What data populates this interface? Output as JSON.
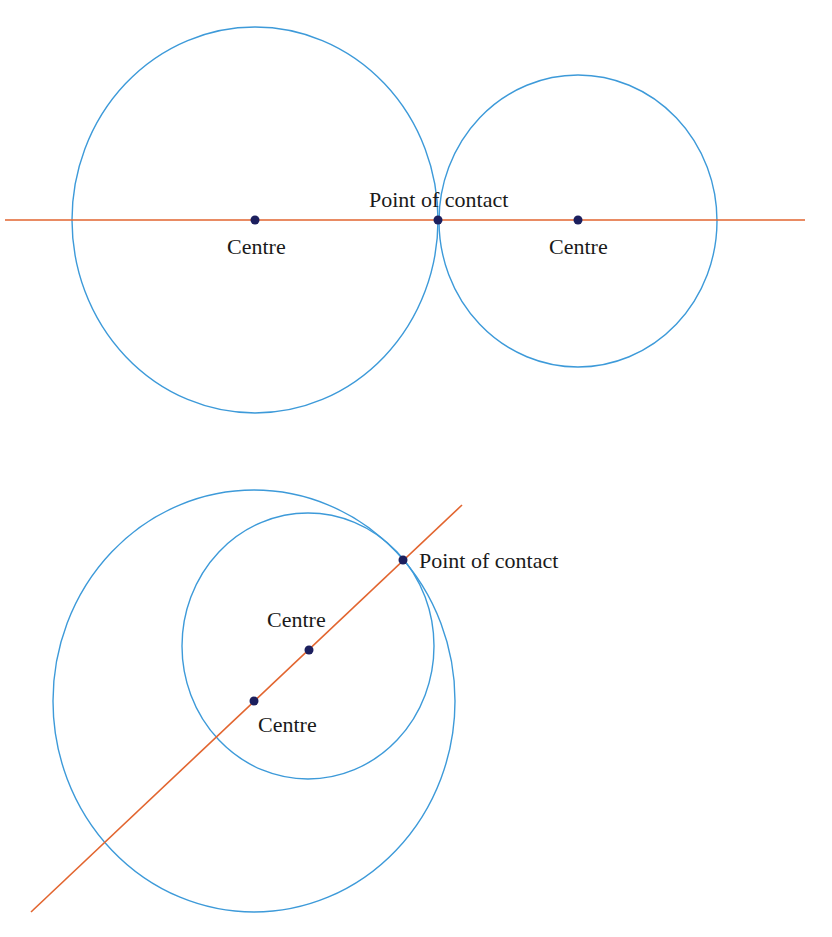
{
  "colors": {
    "circle": "#3d9ad9",
    "line": "#e2652f",
    "dot": "#1c1f5e",
    "text": "#1a1a1a",
    "background": "#ffffff"
  },
  "diagrams": [
    {
      "title": "Circles touching externally",
      "circles": [
        {
          "name": "left-circle",
          "cx": 255,
          "cy": 220,
          "rx": 183,
          "ry": 193
        },
        {
          "name": "right-circle",
          "cx": 578,
          "cy": 221,
          "rx": 139,
          "ry": 146
        }
      ],
      "line": {
        "x1": 5,
        "y1": 220,
        "x2": 805,
        "y2": 220
      },
      "points": [
        {
          "name": "left-centre",
          "x": 255,
          "y": 220
        },
        {
          "name": "point-of-contact",
          "x": 438,
          "y": 220
        },
        {
          "name": "right-centre",
          "x": 578,
          "y": 220
        }
      ],
      "labels": {
        "left_centre": "Centre",
        "contact": "Point of contact",
        "right_centre": "Centre"
      }
    },
    {
      "title": "Circles touching internally",
      "circles": [
        {
          "name": "outer-circle",
          "cx": 254,
          "cy": 701,
          "rx": 201,
          "ry": 211
        },
        {
          "name": "inner-circle",
          "cx": 308,
          "cy": 646,
          "rx": 126,
          "ry": 133
        }
      ],
      "line": {
        "x1": 31,
        "y1": 912,
        "x2": 462,
        "y2": 505
      },
      "points": [
        {
          "name": "point-of-contact",
          "x": 403,
          "y": 560
        },
        {
          "name": "inner-centre",
          "x": 309,
          "y": 650
        },
        {
          "name": "outer-centre",
          "x": 254,
          "y": 701
        }
      ],
      "labels": {
        "contact": "Point of contact",
        "inner_centre": "Centre",
        "outer_centre": "Centre"
      }
    }
  ]
}
